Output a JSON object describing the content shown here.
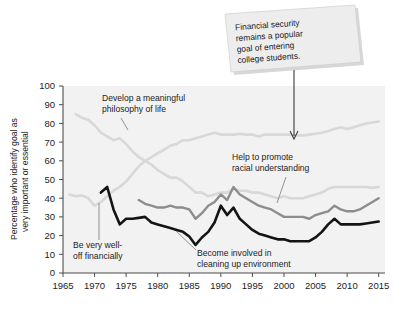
{
  "chart_data": {
    "type": "line",
    "title": "",
    "xlabel": "",
    "ylabel": "Percentage who identify goal as very important or essential",
    "ylabel_line1": "Percentage who identify goal as",
    "ylabel_line2": "very important or essential",
    "xlim": [
      1965,
      2016
    ],
    "ylim": [
      0,
      100
    ],
    "grid": false,
    "legend": "inline-annotations",
    "yticks": [
      0,
      10,
      20,
      30,
      40,
      50,
      60,
      70,
      80,
      90,
      100
    ],
    "xticks": [
      1965,
      1970,
      1975,
      1980,
      1985,
      1990,
      1995,
      2000,
      2005,
      2010,
      2015
    ],
    "series": [
      {
        "name": "Be very well-off financially",
        "color": "#d8d8d8",
        "width": 2.6,
        "x": [
          1966,
          1967,
          1968,
          1969,
          1970,
          1971,
          1972,
          1973,
          1974,
          1975,
          1976,
          1977,
          1978,
          1979,
          1980,
          1981,
          1982,
          1983,
          1984,
          1985,
          1986,
          1987,
          1988,
          1989,
          1990,
          1991,
          1992,
          1993,
          1994,
          1995,
          1996,
          1997,
          1998,
          1999,
          2000,
          2001,
          2002,
          2003,
          2004,
          2005,
          2006,
          2007,
          2008,
          2009,
          2010,
          2011,
          2012,
          2013,
          2014,
          2015
        ],
        "values": [
          42,
          41,
          41.5,
          40,
          36,
          38,
          41,
          44,
          46,
          49,
          53,
          57,
          60,
          62,
          64,
          66,
          68,
          69,
          71,
          71,
          72,
          73,
          74,
          75,
          74,
          74,
          74,
          74.5,
          74,
          74,
          73,
          74,
          74,
          74,
          74,
          74,
          73.5,
          73.5,
          74,
          74.5,
          75,
          76,
          77,
          78,
          77,
          78,
          79,
          80,
          80.5,
          81
        ]
      },
      {
        "name": "Develop a meaningful philosophy of life",
        "color": "#d8d8d8",
        "width": 2.6,
        "x": [
          1967,
          1968,
          1969,
          1970,
          1971,
          1972,
          1973,
          1974,
          1975,
          1976,
          1977,
          1978,
          1979,
          1980,
          1981,
          1982,
          1983,
          1984,
          1985,
          1986,
          1987,
          1988,
          1989,
          1990,
          1991,
          1992,
          1993,
          1994,
          1995,
          1996,
          1997,
          1998,
          1999,
          2000,
          2001,
          2002,
          2003,
          2004,
          2005,
          2006,
          2007,
          2008,
          2009,
          2010,
          2011,
          2012,
          2013,
          2014,
          2015
        ],
        "values": [
          85,
          83,
          82,
          79,
          75,
          73,
          71,
          72,
          69,
          65,
          62,
          60,
          58,
          55,
          53,
          51,
          51,
          49,
          46,
          43,
          43,
          41,
          42,
          43,
          43,
          45,
          44,
          44,
          43,
          43,
          42,
          41,
          40,
          41,
          40,
          40,
          40,
          41,
          42,
          43,
          45,
          46,
          46,
          46,
          46,
          46,
          46,
          45.5,
          46
        ]
      },
      {
        "name": "Help to promote racial understanding",
        "color": "#8d8d8d",
        "width": 2.4,
        "x": [
          1977,
          1978,
          1979,
          1980,
          1981,
          1982,
          1983,
          1984,
          1985,
          1986,
          1987,
          1988,
          1989,
          1990,
          1991,
          1992,
          1993,
          1994,
          1995,
          1996,
          1997,
          1998,
          1999,
          2000,
          2001,
          2002,
          2003,
          2004,
          2005,
          2006,
          2007,
          2008,
          2009,
          2010,
          2011,
          2012,
          2013,
          2014,
          2015
        ],
        "values": [
          39,
          37,
          36,
          35,
          35,
          36,
          35,
          35,
          34,
          29,
          32,
          36,
          38,
          42,
          39,
          46,
          42,
          40,
          38,
          36,
          35,
          34,
          32,
          30,
          30,
          30,
          30,
          29,
          31,
          32,
          33,
          36,
          34,
          33,
          33,
          34,
          36,
          38,
          40
        ]
      },
      {
        "name": "Become involved in cleaning up environment",
        "color": "#141414",
        "width": 2.6,
        "x": [
          1971,
          1972,
          1973,
          1974,
          1975,
          1976,
          1977,
          1978,
          1979,
          1980,
          1981,
          1982,
          1983,
          1984,
          1985,
          1986,
          1987,
          1988,
          1989,
          1990,
          1991,
          1992,
          1993,
          1994,
          1995,
          1996,
          1997,
          1998,
          1999,
          2000,
          2001,
          2002,
          2003,
          2004,
          2005,
          2006,
          2007,
          2008,
          2009,
          2010,
          2011,
          2012,
          2013,
          2014,
          2015
        ],
        "values": [
          43,
          46,
          34,
          26,
          29,
          29,
          29.5,
          30,
          27,
          26,
          25,
          24,
          23,
          22,
          19.5,
          15,
          19,
          22,
          27,
          36,
          31,
          35,
          29,
          26,
          23,
          21,
          20,
          19,
          18,
          18,
          17,
          17,
          17,
          17,
          19,
          22,
          26,
          29,
          26,
          26,
          26,
          26,
          26.5,
          27,
          27.5
        ]
      }
    ],
    "annotations": [
      {
        "name": "philosophy-label",
        "line1": "Develop a meaningful",
        "line2": "philosophy of life"
      },
      {
        "name": "racial-label",
        "line1": "Help to promote",
        "line2": "racial understanding"
      },
      {
        "name": "financial-label",
        "line1": "Be very well-",
        "line2": "off financially"
      },
      {
        "name": "environment-label",
        "line1": "Become involved in",
        "line2": "cleaning up environment"
      }
    ],
    "callout": {
      "line1": "Financial security",
      "line2": "remains a popular",
      "line3": "goal of entering",
      "line4": "college students.",
      "bg_color": "#ededed",
      "target_year": 1998,
      "target_value": 74
    }
  }
}
